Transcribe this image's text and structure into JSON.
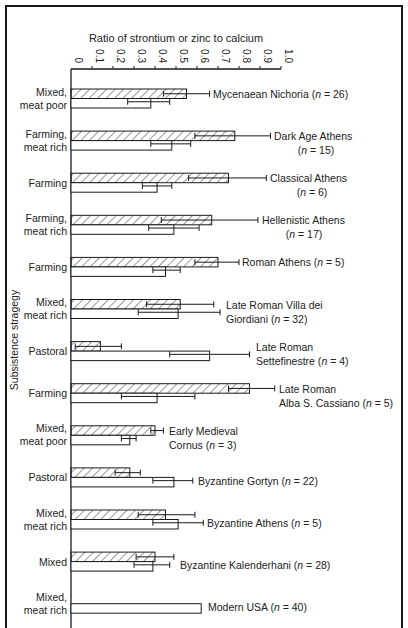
{
  "chart_data": {
    "type": "bar",
    "orientation": "horizontal",
    "title": "",
    "xlabel": "Ratio of strontium or zinc to calcium",
    "ylabel": "Subsistence stragegy",
    "xlim": [
      0,
      1.0
    ],
    "xticks": [
      "0",
      "0.1",
      "0.2",
      "0.3",
      "0.4",
      "0.5",
      "0.6",
      "0.7",
      "0.8",
      "0.9",
      "1.0"
    ],
    "grid": false,
    "legend": "none (hatched bar = strontium/calcium, open bar = zinc/calcium)",
    "series_names": [
      "Strontium (hatched)",
      "Zinc (open)"
    ],
    "groups": [
      {
        "strategy": [
          "Mixed,",
          "meat poor"
        ],
        "site": [
          "Mycenaean Nichoria (n = 26)"
        ],
        "sr": 0.55,
        "sr_err": [
          0.44,
          0.66
        ],
        "zn": 0.38,
        "zn_err": [
          0.27,
          0.47
        ]
      },
      {
        "strategy": [
          "Farming,",
          "meat rich"
        ],
        "site": [
          "Dark Age Athens",
          "(n = 15)"
        ],
        "sr": 0.78,
        "sr_err": [
          0.59,
          0.95
        ],
        "zn": 0.48,
        "zn_err": [
          0.38,
          0.57
        ]
      },
      {
        "strategy": [
          "Farming"
        ],
        "site": [
          "Classical Athens",
          "(n = 6)"
        ],
        "sr": 0.75,
        "sr_err": [
          0.56,
          0.93
        ],
        "zn": 0.41,
        "zn_err": [
          0.34,
          0.48
        ]
      },
      {
        "strategy": [
          "Farming,",
          "meat rich"
        ],
        "site": [
          "Hellenistic Athens",
          "(n = 17)"
        ],
        "sr": 0.67,
        "sr_err": [
          0.43,
          0.89
        ],
        "zn": 0.49,
        "zn_err": [
          0.37,
          0.61
        ]
      },
      {
        "strategy": [
          "Farming"
        ],
        "site": [
          "Roman Athens (n = 5)"
        ],
        "sr": 0.7,
        "sr_err": [
          0.59,
          0.8
        ],
        "zn": 0.45,
        "zn_err": [
          0.39,
          0.52
        ]
      },
      {
        "strategy": [
          "Mixed,",
          "meat rich"
        ],
        "site": [
          "Late Roman Villa dei",
          "Giordiani (n = 32)"
        ],
        "sr": 0.52,
        "sr_err": [
          0.36,
          0.68
        ],
        "zn": 0.51,
        "zn_err": [
          0.32,
          0.71
        ]
      },
      {
        "strategy": [
          "Pastoral"
        ],
        "site": [
          "Late Roman",
          "Settefinestre (n = 4)"
        ],
        "sr": 0.14,
        "sr_err": [
          0.02,
          0.24
        ],
        "zn": 0.66,
        "zn_err": [
          0.47,
          0.85
        ]
      },
      {
        "strategy": [
          "Farming"
        ],
        "site": [
          "Late Roman",
          "Alba S. Cassiano (n = 5)"
        ],
        "sr": 0.85,
        "sr_err": [
          0.75,
          0.97
        ],
        "zn": 0.41,
        "zn_err": [
          0.24,
          0.59
        ]
      },
      {
        "strategy": [
          "Mixed,",
          "meat poor"
        ],
        "site": [
          "Early Medieval",
          "Cornus (n = 3)"
        ],
        "sr": 0.4,
        "sr_err": [
          0.38,
          0.44
        ],
        "zn": 0.28,
        "zn_err": [
          0.24,
          0.31
        ]
      },
      {
        "strategy": [
          "Pastoral"
        ],
        "site": [
          "Byzantine Gortyn (n = 22)"
        ],
        "sr": 0.28,
        "sr_err": [
          0.21,
          0.33
        ],
        "zn": 0.49,
        "zn_err": [
          0.39,
          0.58
        ]
      },
      {
        "strategy": [
          "Mixed,",
          "meat rich"
        ],
        "site": [
          "Byzantine Athens (n = 5)"
        ],
        "sr": 0.45,
        "sr_err": [
          0.32,
          0.59
        ],
        "zn": 0.51,
        "zn_err": [
          0.39,
          0.63
        ]
      },
      {
        "strategy": [
          "Mixed"
        ],
        "site": [
          "Byzantine Kalenderhani (n = 28)"
        ],
        "sr": 0.4,
        "sr_err": [
          0.31,
          0.49
        ],
        "zn": 0.39,
        "zn_err": [
          0.3,
          0.47
        ]
      },
      {
        "strategy": [
          "Mixed,",
          "meat rich"
        ],
        "site": [
          "Modern USA (n = 40)"
        ],
        "sr": null,
        "sr_err": null,
        "zn": 0.62,
        "zn_err": null
      }
    ]
  },
  "layout": {
    "axis_x0": 71,
    "axis_px_per_unit": 210,
    "axis_y": 69,
    "group_top": 89,
    "group_step": 42.1,
    "bar_h": 9.5,
    "site_label_offsets": [
      {
        "x": 213,
        "dy": 5
      },
      {
        "x": 274,
        "dy": 5
      },
      {
        "x": 270,
        "dy": 5
      },
      {
        "x": 262,
        "dy": 5
      },
      {
        "x": 242,
        "dy": 5
      },
      {
        "x": 226,
        "dy": 5
      },
      {
        "x": 256,
        "dy": 5
      },
      {
        "x": 279,
        "dy": 5
      },
      {
        "x": 169,
        "dy": 5
      },
      {
        "x": 198,
        "dy": 13
      },
      {
        "x": 207,
        "dy": 13
      },
      {
        "x": 180,
        "dy": 13
      },
      {
        "x": 208,
        "dy": 13
      }
    ]
  }
}
